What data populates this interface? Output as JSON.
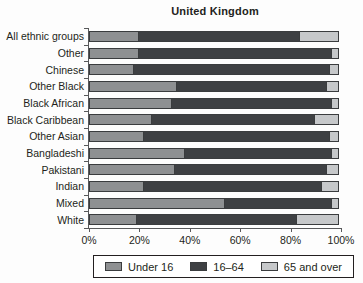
{
  "chart_data": {
    "type": "bar",
    "orientation": "horizontal",
    "stacked": true,
    "title": "United Kingdom",
    "categories": [
      "All ethnic groups",
      "Other",
      "Chinese",
      "Other Black",
      "Black African",
      "Black Caribbean",
      "Other Asian",
      "Bangladeshi",
      "Pakistani",
      "Indian",
      "Mixed",
      "White"
    ],
    "series": [
      {
        "name": "Under 16",
        "key": "under-16",
        "color": "#8e9092",
        "values": [
          20,
          20,
          18,
          35,
          33,
          25,
          22,
          38,
          34,
          22,
          54,
          19
        ]
      },
      {
        "name": "16–64",
        "key": "16-64",
        "color": "#3e4043",
        "values": [
          64,
          77,
          78,
          60,
          64,
          65,
          74,
          59,
          61,
          71,
          43,
          64
        ]
      },
      {
        "name": "65 and over",
        "key": "65-and-over",
        "color": "#c6c8ca",
        "values": [
          16,
          3,
          4,
          5,
          3,
          10,
          4,
          3,
          5,
          7,
          3,
          17
        ]
      }
    ],
    "xlim": [
      0,
      100
    ],
    "grid": false,
    "legend_position": "bottom",
    "units": "%"
  },
  "x_axis": {
    "ticks": [
      {
        "label": "0%",
        "value": 0
      },
      {
        "label": "20%",
        "value": 20
      },
      {
        "label": "40%",
        "value": 40
      },
      {
        "label": "60%",
        "value": 60
      },
      {
        "label": "80%",
        "value": 80
      },
      {
        "label": "100%",
        "value": 100
      }
    ]
  },
  "legend": {
    "items": [
      {
        "label": "Under 16",
        "key": "under-16",
        "color": "#8e9092"
      },
      {
        "label": "16–64",
        "key": "16-64",
        "color": "#3e4043"
      },
      {
        "label": "65 and over",
        "key": "65-and-over",
        "color": "#c6c8ca"
      }
    ]
  }
}
